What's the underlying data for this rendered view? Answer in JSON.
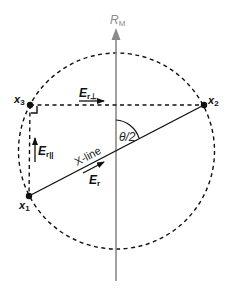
{
  "diagram": {
    "axis": {
      "label_main": "R",
      "label_sub": "M",
      "color": "#8a8a8a"
    },
    "points": [
      {
        "id": "x1",
        "label_main": "x",
        "label_sub": "1"
      },
      {
        "id": "x2",
        "label_main": "x",
        "label_sub": "2"
      },
      {
        "id": "x3",
        "label_main": "x",
        "label_sub": "3"
      }
    ],
    "vectors": {
      "e_r": {
        "label_main": "E",
        "label_sub": "r"
      },
      "e_r_parallel": {
        "label_main": "E",
        "label_sub": "r||"
      },
      "e_r_perp": {
        "label_main": "E",
        "label_sub": "r⊥"
      }
    },
    "xline_label": "X-line",
    "angle_label": "θ/2",
    "circle_style": "dashed",
    "line_color": "#111111"
  }
}
